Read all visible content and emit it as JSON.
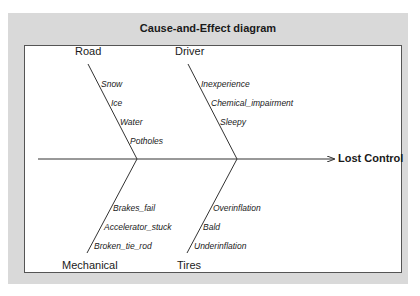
{
  "title": "Cause-and-Effect diagram",
  "effect": "Lost Control",
  "categories": {
    "road": {
      "label": "Road",
      "causes": [
        "Snow",
        "Ice",
        "Water",
        "Potholes"
      ]
    },
    "driver": {
      "label": "Driver",
      "causes": [
        "Inexperience",
        "Chemical_impairment",
        "Sleepy"
      ]
    },
    "mechanical": {
      "label": "Mechanical",
      "causes": [
        "Brakes_fail",
        "Accelerator_stuck",
        "Broken_tie_rod"
      ]
    },
    "tires": {
      "label": "Tires",
      "causes": [
        "Overinflation",
        "Bald",
        "Underinflation"
      ]
    }
  },
  "colors": {
    "panel_bg": "#d9d9d9",
    "plot_bg": "#ffffff",
    "line": "#333333",
    "text": "#1a1a1a"
  }
}
